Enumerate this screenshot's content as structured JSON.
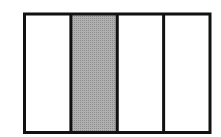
{
  "diagram": {
    "type": "fraction-bar",
    "parts": 4,
    "shaded_parts": [
      2
    ],
    "fraction_shaded": "1/4",
    "colors": {
      "border": "#111111",
      "shaded_fill": "#a9a9a9",
      "unshaded_fill": "#ffffff"
    }
  }
}
